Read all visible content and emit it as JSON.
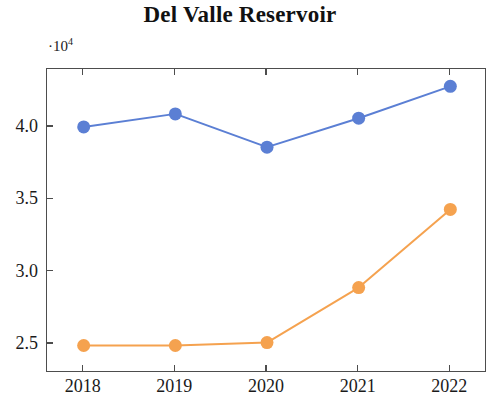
{
  "chart_data": {
    "type": "line",
    "title": "Del Valle Reservoir",
    "xlabel": "",
    "ylabel": "",
    "y_multiplier_prefix": "·10",
    "y_multiplier_exponent": "4",
    "y_multiplier_label": "·10⁴",
    "categories": [
      "2018",
      "2019",
      "2020",
      "2021",
      "2022"
    ],
    "x": [
      2018,
      2019,
      2020,
      2021,
      2022
    ],
    "xlim": [
      2017.6,
      2022.4
    ],
    "ylim": [
      23000,
      44000
    ],
    "yticks": [
      25000,
      30000,
      35000,
      40000
    ],
    "ytick_labels": [
      "2.5",
      "3.0",
      "3.5",
      "4.0"
    ],
    "xtick_labels": [
      "2018",
      "2019",
      "2020",
      "2021",
      "2022"
    ],
    "grid": false,
    "legend": "none",
    "series": [
      {
        "name": "series-1",
        "color": "#5b7fd4",
        "marker": "circle",
        "values": [
          40000,
          40900,
          38600,
          40600,
          42800
        ]
      },
      {
        "name": "series-2",
        "color": "#f5a24f",
        "marker": "circle",
        "values": [
          24900,
          24900,
          25100,
          28900,
          34300
        ]
      }
    ]
  },
  "colors": {
    "series_1": "#5b7fd4",
    "series_2": "#f5a24f",
    "axis": "#4d4d4d",
    "text": "#1a1a1a",
    "background": "#ffffff"
  }
}
